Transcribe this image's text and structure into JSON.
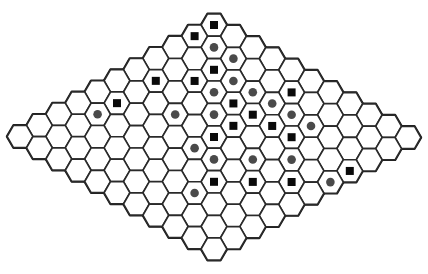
{
  "board": {
    "type": "hex",
    "size": 11,
    "cell_shape": "flat-top-hexagon",
    "origin_top": [
      214,
      25
    ],
    "step_col": [
      19.4,
      11.25
    ],
    "step_row": [
      -19.4,
      11.15
    ],
    "hex_radius": 12.9,
    "colors": {
      "cell_fill": "#ffffff",
      "cell_stroke": "#2a2a2a",
      "square_stone": "#0a0a0a",
      "circle_stone": "#4a4a4a"
    }
  },
  "stones": {
    "squares": [
      [
        0,
        0
      ],
      [
        1,
        0
      ],
      [
        2,
        2
      ],
      [
        3,
        2
      ],
      [
        4,
        1
      ],
      [
        6,
        1
      ],
      [
        3,
        4
      ],
      [
        1,
        5
      ],
      [
        3,
        5
      ],
      [
        4,
        5
      ],
      [
        3,
        6
      ],
      [
        5,
        5
      ],
      [
        3,
        7
      ],
      [
        7,
        7
      ],
      [
        6,
        8
      ],
      [
        5,
        9
      ],
      [
        3,
        10
      ]
    ],
    "circles": [
      [
        1,
        1
      ],
      [
        1,
        2
      ],
      [
        2,
        3
      ],
      [
        3,
        3
      ],
      [
        2,
        4
      ],
      [
        2,
        5
      ],
      [
        4,
        4
      ],
      [
        2,
        6
      ],
      [
        2,
        7
      ],
      [
        5,
        3
      ],
      [
        7,
        1
      ],
      [
        6,
        5
      ],
      [
        6,
        6
      ],
      [
        5,
        7
      ],
      [
        4,
        8
      ],
      [
        8,
        7
      ],
      [
        4,
        10
      ]
    ]
  },
  "counts": {
    "squares": 17,
    "circles": 17
  }
}
